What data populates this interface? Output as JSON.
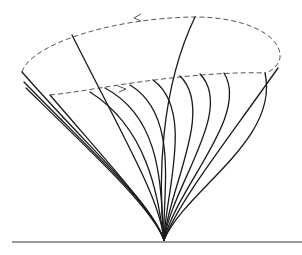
{
  "diagram": {
    "colors": {
      "curves": "#1a1a1a",
      "dashed_rims": "#555555",
      "ground": "#333333",
      "background": "#ffffff"
    },
    "base_point": [
      164,
      240
    ],
    "ground_line": {
      "x1": 12,
      "x2": 302,
      "y": 242
    },
    "outer_rim": {
      "style": "dashed",
      "arrow_direction": "left",
      "arrow_at": [
        136,
        18
      ]
    },
    "inner_rim": {
      "style": "dashed",
      "arrow_direction": "right",
      "arrow_at": [
        122,
        90
      ]
    },
    "solid_curve_count": 14
  }
}
